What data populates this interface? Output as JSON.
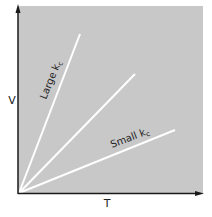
{
  "figure": {
    "x_axis_label": "T",
    "y_axis_label": "V",
    "line_labels": {
      "large": "Large k",
      "large_sub": "c",
      "small": "Small k",
      "small_sub": "c"
    },
    "colors": {
      "panel": "#c8c8c8",
      "lines": "#ffffff",
      "axes": "#1a1a1a"
    },
    "lines": [
      {
        "name": "large-kc",
        "x2": 80,
        "y2": 34
      },
      {
        "name": "medium-kc",
        "x2": 135,
        "y2": 74
      },
      {
        "name": "small-kc",
        "x2": 175,
        "y2": 130
      }
    ]
  }
}
